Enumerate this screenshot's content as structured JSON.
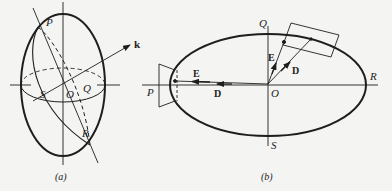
{
  "figure": {
    "panels": [
      {
        "id": "a",
        "caption": "(a)",
        "labels": {
          "P": "P",
          "S": "S",
          "O": "O",
          "Q": "Q",
          "R": "R",
          "k": "k"
        }
      },
      {
        "id": "b",
        "caption": "(b)",
        "labels": {
          "Q": "Q",
          "R": "R",
          "P": "P",
          "O": "O",
          "S": "S",
          "E_left": "E",
          "D_left": "D",
          "E_top": "E",
          "D_top": "D"
        }
      }
    ]
  },
  "colors": {
    "ink": "#1e1e1e",
    "background": "#f4f4f2"
  }
}
